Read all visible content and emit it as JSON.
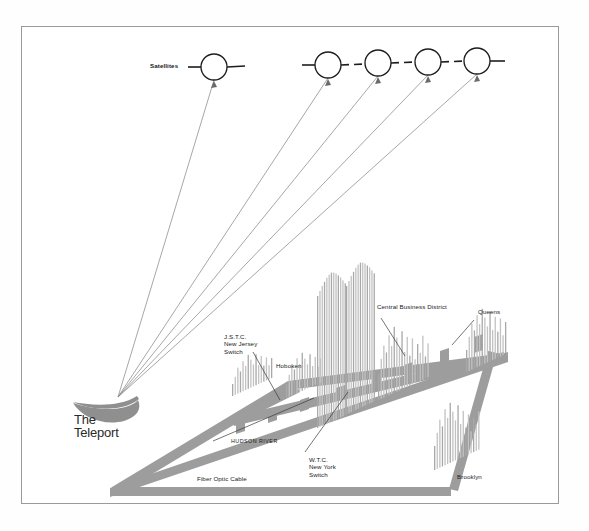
{
  "figure": {
    "frame_color": "#9a9a9a",
    "cable_color": "#9d9d9d",
    "dish_color": "#8f8f8f",
    "building_color": "#b9b9b9",
    "beam_color": "#8a8a8a",
    "background": "#ffffff"
  },
  "brand": {
    "line1": "The",
    "line2": "Teleport"
  },
  "satellites": {
    "label": "Satellites",
    "left_group": [
      {
        "cx": 214,
        "cy": 67,
        "r": 13
      }
    ],
    "right_group": [
      {
        "cx": 328,
        "cy": 65,
        "r": 13
      },
      {
        "cx": 378,
        "cy": 63,
        "r": 13
      },
      {
        "cx": 428,
        "cy": 62,
        "r": 13
      },
      {
        "cx": 477,
        "cy": 61,
        "r": 13
      }
    ]
  },
  "labels": [
    {
      "id": "jstc",
      "name": "jstc-label",
      "text": "J.S.T.C.\nNew Jersey\nSwitch",
      "x": 224,
      "y": 333,
      "style": "lbl-sm"
    },
    {
      "id": "hoboken",
      "name": "hoboken-label",
      "text": "Hoboken",
      "x": 276,
      "y": 362,
      "style": "lbl-sm"
    },
    {
      "id": "cbd",
      "name": "central-business-district-label",
      "text": "Central Business District",
      "x": 377,
      "y": 303,
      "style": "lbl-sm"
    },
    {
      "id": "queens",
      "name": "queens-label",
      "text": "Queens",
      "x": 478,
      "y": 308,
      "style": "lbl-sm"
    },
    {
      "id": "wtc",
      "name": "wtc-label",
      "text": "W.T.C.\nNew York\nSwitch",
      "x": 309,
      "y": 456,
      "style": "lbl-sm"
    },
    {
      "id": "hudson",
      "name": "hudson-river-label",
      "text": "HUDSON RIVER",
      "x": 231,
      "y": 438,
      "style": "lbl-cap"
    },
    {
      "id": "fiber",
      "name": "fiber-optic-cable-label",
      "text": "Fiber Optic Cable",
      "x": 197,
      "y": 475,
      "style": "lbl-sm"
    },
    {
      "id": "brooklyn",
      "name": "brooklyn-label",
      "text": "Brooklyn",
      "x": 457,
      "y": 473,
      "style": "lbl-sm"
    }
  ],
  "ground_station": {
    "x": 118,
    "y": 397
  },
  "leaders": [
    {
      "name": "jstc-leader",
      "x1": 253,
      "y1": 352,
      "x2": 280,
      "y2": 400
    },
    {
      "name": "cbd-leader",
      "x1": 381,
      "y1": 318,
      "x2": 405,
      "y2": 356
    },
    {
      "name": "hudson-leader",
      "x1": 213,
      "y1": 441,
      "x2": 314,
      "y2": 398
    },
    {
      "name": "wtc-leader",
      "x1": 305,
      "y1": 452,
      "x2": 348,
      "y2": 392
    },
    {
      "name": "queens-leader",
      "x1": 452,
      "y1": 345,
      "x2": 474,
      "y2": 320
    }
  ],
  "skylines": [
    {
      "name": "skyline-jersey",
      "x": 232,
      "y": 396,
      "bars": 16,
      "heights": [
        12,
        18,
        26,
        21,
        30,
        24,
        34,
        28,
        22,
        31,
        19,
        27,
        16,
        23,
        14,
        20
      ],
      "spacing": 2.6,
      "slant": -0.46
    },
    {
      "name": "skyline-hoboken",
      "x": 286,
      "y": 398,
      "bars": 14,
      "heights": [
        14,
        22,
        30,
        25,
        35,
        28,
        38,
        31,
        24,
        33,
        20,
        28,
        17,
        24
      ],
      "spacing": 2.6,
      "slant": -0.46
    },
    {
      "name": "skyline-wtc-left",
      "x": 317,
      "y": 428,
      "bars": 13,
      "heights": [
        132,
        136,
        140,
        143,
        146,
        148,
        149,
        148,
        146,
        143,
        140,
        136,
        132
      ],
      "spacing": 2.3,
      "slant": -0.46
    },
    {
      "name": "skyline-wtc-right",
      "x": 346,
      "y": 414,
      "bars": 13,
      "heights": [
        128,
        132,
        136,
        139,
        142,
        144,
        145,
        144,
        142,
        139,
        136,
        132,
        128
      ],
      "spacing": 2.3,
      "slant": -0.46
    },
    {
      "name": "skyline-cbd",
      "x": 378,
      "y": 400,
      "bars": 20,
      "heights": [
        26,
        40,
        52,
        44,
        60,
        48,
        66,
        54,
        42,
        58,
        36,
        50,
        30,
        46,
        24,
        38,
        28,
        44,
        22,
        34
      ],
      "spacing": 2.6,
      "slant": -0.46
    },
    {
      "name": "skyline-queens",
      "x": 466,
      "y": 372,
      "bars": 16,
      "heights": [
        22,
        34,
        46,
        38,
        52,
        42,
        56,
        46,
        36,
        50,
        30,
        42,
        26,
        38,
        20,
        32
      ],
      "spacing": 2.6,
      "slant": -0.46
    },
    {
      "name": "skyline-brooklyn",
      "x": 434,
      "y": 470,
      "bars": 18,
      "heights": [
        24,
        36,
        48,
        40,
        56,
        46,
        60,
        50,
        40,
        54,
        34,
        46,
        28,
        40,
        22,
        34,
        26,
        38
      ],
      "spacing": 2.6,
      "slant": -0.46
    }
  ]
}
